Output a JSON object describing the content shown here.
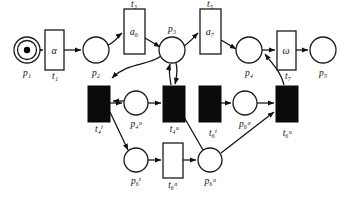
{
  "diagram": {
    "colors": {
      "stroke": "#111111",
      "fill_open": "#ffffff",
      "fill_solid": "#0b0b0b",
      "token": "#000000",
      "background": "#ffffff"
    },
    "places": [
      {
        "id": "p1",
        "name": "p",
        "sub": "1",
        "sup": "",
        "label": "p₁",
        "tokens": 1,
        "cx": 27,
        "cy": 50,
        "r": 13,
        "double": true,
        "label_x": 27,
        "label_y": 76
      },
      {
        "id": "p2",
        "name": "p",
        "sub": "2",
        "sup": "",
        "label": "p₂",
        "tokens": 0,
        "cx": 96,
        "cy": 50,
        "r": 13,
        "double": false,
        "label_x": 96,
        "label_y": 76
      },
      {
        "id": "p3",
        "name": "p",
        "sub": "3",
        "sup": "",
        "label": "p₃",
        "tokens": 0,
        "cx": 172,
        "cy": 50,
        "r": 13,
        "double": false,
        "label_x": 172,
        "label_y": 32
      },
      {
        "id": "p4",
        "name": "p",
        "sub": "4",
        "sup": "",
        "label": "p₄",
        "tokens": 0,
        "cx": 249,
        "cy": 50,
        "r": 13,
        "double": false,
        "label_x": 249,
        "label_y": 76
      },
      {
        "id": "p5",
        "name": "p",
        "sub": "5",
        "sup": "",
        "label": "p₅",
        "tokens": 0,
        "cx": 323,
        "cy": 50,
        "r": 13,
        "double": false,
        "label_x": 323,
        "label_y": 76
      },
      {
        "id": "p4a",
        "name": "p",
        "sub": "4",
        "sup": "o",
        "label": "p₄ᵒ",
        "tokens": 0,
        "cx": 136,
        "cy": 103,
        "r": 12,
        "double": false,
        "label_x": 136,
        "label_y": 127
      },
      {
        "id": "p6a",
        "name": "p",
        "sub": "6",
        "sup": "a",
        "label": "p₆ᵃ",
        "tokens": 0,
        "cx": 245,
        "cy": 103,
        "r": 12,
        "double": false,
        "label_x": 245,
        "label_y": 127
      },
      {
        "id": "p6i",
        "name": "p",
        "sub": "6",
        "sup": "i",
        "label": "p₆ⁱ",
        "tokens": 0,
        "cx": 136,
        "cy": 160,
        "r": 12,
        "double": false,
        "label_x": 136,
        "label_y": 184
      },
      {
        "id": "p6o",
        "name": "p",
        "sub": "6",
        "sup": "o",
        "label": "p₆ᵒ",
        "tokens": 0,
        "cx": 210,
        "cy": 160,
        "r": 12,
        "double": false,
        "label_x": 210,
        "label_y": 184
      }
    ],
    "transitions": [
      {
        "id": "t1",
        "label": "t₁",
        "inner": "α",
        "style": "open",
        "x": 45,
        "y": 30,
        "w": 19,
        "h": 40,
        "label_x": 55,
        "label_y": 79,
        "inner_x": 54,
        "inner_y": 54
      },
      {
        "id": "t3",
        "label": "t₃",
        "inner": "a₆",
        "style": "open",
        "x": 124,
        "y": 9,
        "w": 21,
        "h": 45,
        "label_x": 134,
        "label_y": 7,
        "inner_x": 134,
        "inner_y": 35
      },
      {
        "id": "t5",
        "label": "t₅",
        "inner": "a₇",
        "style": "open",
        "x": 200,
        "y": 9,
        "w": 21,
        "h": 45,
        "label_x": 210,
        "label_y": 7,
        "inner_x": 210,
        "inner_y": 35
      },
      {
        "id": "t7",
        "label": "t₇",
        "inner": "ω",
        "style": "open",
        "x": 277,
        "y": 31,
        "w": 19,
        "h": 39,
        "label_x": 288,
        "label_y": 79,
        "inner_x": 286,
        "inner_y": 54
      },
      {
        "id": "t4i",
        "label": "t₄ⁱ",
        "inner": "",
        "style": "solid",
        "x": 88,
        "y": 86,
        "w": 22,
        "h": 36,
        "label_x": 99,
        "label_y": 132,
        "inner_x": 0,
        "inner_y": 0
      },
      {
        "id": "t4o",
        "label": "t₄ᵒ",
        "inner": "",
        "style": "solid",
        "x": 163,
        "y": 86,
        "w": 22,
        "h": 36,
        "label_x": 174,
        "label_y": 132,
        "inner_x": 0,
        "inner_y": 0
      },
      {
        "id": "t6i",
        "label": "t₆ⁱ",
        "inner": "",
        "style": "solid",
        "x": 199,
        "y": 86,
        "w": 22,
        "h": 36,
        "label_x": 213,
        "label_y": 136,
        "inner_x": 0,
        "inner_y": 0
      },
      {
        "id": "t6o",
        "label": "t₆ᵒ",
        "inner": "",
        "style": "solid",
        "x": 276,
        "y": 86,
        "w": 22,
        "h": 36,
        "label_x": 287,
        "label_y": 136,
        "inner_x": 0,
        "inner_y": 0
      },
      {
        "id": "t6a",
        "label": "t₆ᵃ",
        "inner": "",
        "style": "open",
        "x": 163,
        "y": 143,
        "w": 20,
        "h": 35,
        "label_x": 173,
        "label_y": 188,
        "inner_x": 0,
        "inner_y": 0
      }
    ],
    "arcs": [
      {
        "from": "p1",
        "to": "t1",
        "kind": "straight"
      },
      {
        "from": "t1",
        "to": "p2",
        "kind": "straight"
      },
      {
        "from": "p2",
        "to": "t3",
        "kind": "curve"
      },
      {
        "from": "t3",
        "to": "p3",
        "kind": "curve"
      },
      {
        "from": "p3",
        "to": "t5",
        "kind": "curve"
      },
      {
        "from": "t5",
        "to": "p4",
        "kind": "curve"
      },
      {
        "from": "p4",
        "to": "t7",
        "kind": "straight"
      },
      {
        "from": "t7",
        "to": "p5",
        "kind": "straight"
      },
      {
        "from": "p3",
        "to": "t4i",
        "kind": "curve"
      },
      {
        "from": "p3",
        "to": "t4o",
        "kind": "curve"
      },
      {
        "from": "t4i",
        "to": "p4a",
        "kind": "straight"
      },
      {
        "from": "p4a",
        "to": "t4o",
        "kind": "straight"
      },
      {
        "from": "p4a",
        "to": "t4i",
        "kind": "straight"
      },
      {
        "from": "t4o",
        "to": "p3",
        "kind": "curve"
      },
      {
        "from": "t4i",
        "to": "p6i",
        "kind": "straight"
      },
      {
        "from": "p6i",
        "to": "t6a",
        "kind": "straight"
      },
      {
        "from": "t6a",
        "to": "p6o",
        "kind": "straight"
      },
      {
        "from": "p6o",
        "to": "t4o",
        "kind": "straight"
      },
      {
        "from": "p6o",
        "to": "t6o",
        "kind": "straight"
      },
      {
        "from": "t6i",
        "to": "p6a",
        "kind": "straight"
      },
      {
        "from": "p6a",
        "to": "t6o",
        "kind": "straight"
      },
      {
        "from": "t6o",
        "to": "p4",
        "kind": "curve"
      }
    ]
  }
}
